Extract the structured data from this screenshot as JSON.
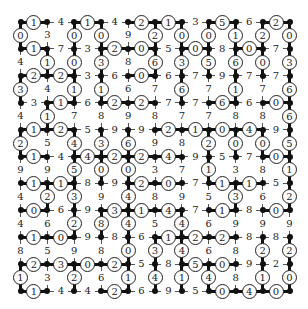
{
  "puzzle": {
    "type": "grid-path-puzzle",
    "rows": 11,
    "cols": 11,
    "note": "Circled numbers mark edges on the drawn path (thick lines); plain numbers are edges not on the path.",
    "horizontal_edges": [
      [
        "1c",
        "4",
        "1c",
        "4",
        "2c",
        "1c",
        "3",
        "5c",
        "6",
        "2c"
      ],
      [
        "1c",
        "7",
        "3",
        "2c",
        "0c",
        "5",
        "0c",
        "8",
        "0c",
        "7"
      ],
      [
        "2c",
        "2c",
        "3",
        "6",
        "0c",
        "6",
        "7",
        "9",
        "7",
        "7"
      ],
      [
        "3",
        "1c",
        "6",
        "2c",
        "2c",
        "7",
        "7",
        "6c",
        "6",
        "0c"
      ],
      [
        "1c",
        "2c",
        "5",
        "9",
        "9",
        "2c",
        "1c",
        "0c",
        "4c",
        "9"
      ],
      [
        "1c",
        "4",
        "4c",
        "2c",
        "2c",
        "4c",
        "9",
        "5",
        "7",
        "0c"
      ],
      [
        "1c",
        "1c",
        "8",
        "9",
        "2c",
        "0c",
        "7",
        "1c",
        "1c",
        "5"
      ],
      [
        "0c",
        "6",
        "9",
        "3c",
        "1c",
        "4c",
        "7",
        "1c",
        "8",
        "0c"
      ],
      [
        "1c",
        "0c",
        "9",
        "8",
        "6",
        "1c",
        "2c",
        "2c",
        "8",
        "8"
      ],
      [
        "2c",
        "3c",
        "0c",
        "2c",
        "5",
        "8",
        "5c",
        "0c",
        "9",
        "2"
      ],
      [
        "1c",
        "4",
        "4",
        "2c",
        "6",
        "9",
        "5",
        "0c",
        "4c",
        "0c"
      ]
    ],
    "vertical_edges": [
      [
        "0c",
        "3",
        "0c",
        "0c",
        "9",
        "2c",
        "0c",
        "0c",
        "1c",
        "2c",
        "0c"
      ],
      [
        "4",
        "1c",
        "0c",
        "3c",
        "8",
        "6c",
        "3c",
        "5c",
        "6c",
        "0c",
        "3c"
      ],
      [
        "3c",
        "4",
        "1c",
        "1c",
        "6",
        "7",
        "6c",
        "7",
        "1c",
        "7",
        "6c"
      ],
      [
        "4",
        "1c",
        "7",
        "8",
        "9",
        "8",
        "7",
        "7",
        "8",
        "8",
        "6c"
      ],
      [
        "2c",
        "5",
        "4c",
        "3c",
        "6c",
        "9",
        "8",
        "2c",
        "0c",
        "0c",
        "5c"
      ],
      [
        "9",
        "9",
        "5c",
        "0c",
        "0c",
        "3",
        "7",
        "1c",
        "3",
        "8",
        "1c"
      ],
      [
        "4",
        "2c",
        "3c",
        "9",
        "4c",
        "8",
        "9",
        "5",
        "3c",
        "6",
        "2c"
      ],
      [
        "4",
        "6",
        "2c",
        "8c",
        "4c",
        "5",
        "4c",
        "6",
        "9",
        "9",
        "9"
      ],
      [
        "8",
        "5",
        "9",
        "8",
        "0c",
        "3c",
        "4c",
        "6",
        "8",
        "2c",
        "2c"
      ],
      [
        "1c",
        "3",
        "2c",
        "6",
        "1c",
        "4c",
        "1c",
        "4c",
        "8",
        "1c",
        "0c"
      ]
    ]
  }
}
